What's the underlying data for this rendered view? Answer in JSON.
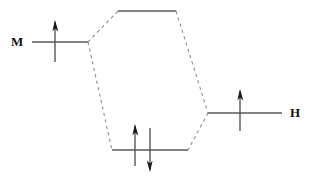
{
  "diagram": {
    "kind": "molecular-orbital-interaction-diagram",
    "title": "",
    "background_color": "#ffffff",
    "line_color": "#5a5a5a",
    "correlation_line_color": "#8d8d8d",
    "electron_color": "#1a1a1a"
  },
  "fragments": {
    "left": {
      "label": "M",
      "label_x": 11,
      "label_y": 35,
      "level": {
        "x1": 32,
        "x2": 88,
        "y": 42
      },
      "electrons": [
        {
          "spin": "up",
          "x": 55,
          "top": 20,
          "bottom": 62
        }
      ]
    },
    "right": {
      "label": "H",
      "label_x": 290,
      "label_y": 106,
      "level": {
        "x1": 208,
        "x2": 282,
        "y": 113
      },
      "electrons": [
        {
          "spin": "up",
          "x": 240,
          "top": 89,
          "bottom": 131
        }
      ]
    }
  },
  "molecular_orbitals": {
    "antibonding": {
      "name": "antibonding-level",
      "level": {
        "x1": 118,
        "x2": 176,
        "y": 11
      },
      "electrons": []
    },
    "bonding": {
      "name": "bonding-level",
      "level": {
        "x1": 112,
        "x2": 188,
        "y": 150
      },
      "electrons": [
        {
          "spin": "up",
          "x": 135,
          "top": 124,
          "bottom": 166
        },
        {
          "spin": "down",
          "x": 150,
          "top": 128,
          "bottom": 172
        }
      ]
    }
  },
  "correlation_lines": [
    {
      "name": "left-to-antibonding",
      "x1": 88,
      "y1": 42,
      "x2": 118,
      "y2": 11
    },
    {
      "name": "left-to-bonding",
      "x1": 88,
      "y1": 42,
      "x2": 112,
      "y2": 150
    },
    {
      "name": "antibonding-to-right",
      "x1": 176,
      "y1": 11,
      "x2": 208,
      "y2": 113
    },
    {
      "name": "right-to-bonding",
      "x1": 208,
      "y1": 113,
      "x2": 188,
      "y2": 150
    }
  ]
}
